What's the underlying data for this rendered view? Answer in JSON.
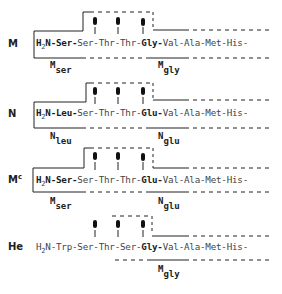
{
  "rows": [
    {
      "label": "M",
      "label_sup": "",
      "sequence": [
        {
          "text": "H",
          "bold": true
        },
        {
          "sub": "2"
        },
        {
          "text": "N-Ser-",
          "bold": true
        },
        {
          "text": "Ser-Thr-Thr-",
          "bold": false
        },
        {
          "text": "Gly-",
          "bold": true
        },
        {
          "text": "Val-Ala-Met-His-",
          "bold": false
        }
      ],
      "sites": [
        "M_ser",
        "M_gly"
      ],
      "left_label": {
        "main": "M",
        "sub": "ser"
      },
      "right_label": {
        "main": "M",
        "sub": "gly"
      }
    },
    {
      "label": "N",
      "label_sup": "",
      "left_label": {
        "main": "N",
        "sub": "leu"
      },
      "right_label": {
        "main": "N",
        "sub": "glu"
      }
    },
    {
      "label": "M",
      "label_sup": "c",
      "left_label": {
        "main": "M",
        "sub": "ser"
      },
      "right_label": {
        "main": "N",
        "sub": "glu"
      }
    },
    {
      "label": "He",
      "label_sup": "",
      "left_label": null,
      "right_label": {
        "main": "M",
        "sub": "gly"
      }
    }
  ],
  "text": {
    "r0": {
      "label": "M",
      "h": "H",
      "two": "2",
      "n": "N-Ser-",
      "mid": "Ser-Thr-Thr-",
      "key": "Gly-",
      "tail": "Val-Ala-Met-His-",
      "ll": "M",
      "lls": "ser",
      "rl": "M",
      "rls": "gly"
    },
    "r1": {
      "label": "N",
      "h": "H",
      "two": "2",
      "n": "N-Leu-",
      "mid": "Ser-Thr-Thr-",
      "key": "Glu-",
      "tail": "Val-Ala-Met-His-",
      "ll": "N",
      "lls": "leu",
      "rl": "N",
      "rls": "glu"
    },
    "r2": {
      "label": "M",
      "sup": "c",
      "h": "H",
      "two": "2",
      "n": "N-Ser-",
      "mid": "Ser-Thr-Thr-",
      "key": "Glu-",
      "tail": "Val-Ala-Met-His-",
      "ll": "M",
      "lls": "ser",
      "rl": "N",
      "rls": "glu"
    },
    "r3": {
      "label": "He",
      "h": "H",
      "two": "2",
      "n": "N-Trp-Ser-Thr-Ser-",
      "key": "Gly-",
      "tail": "Val-Ala-Met-His-",
      "rl": "M",
      "rls": "gly"
    }
  }
}
